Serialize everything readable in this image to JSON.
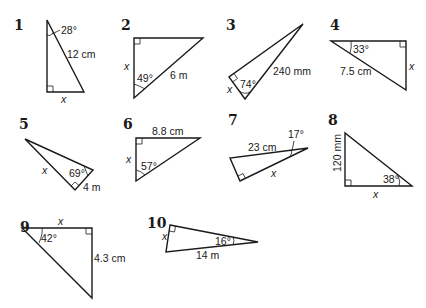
{
  "problems": [
    {
      "number": "1",
      "angle": "28°",
      "side": "12 cm",
      "unknown": "x"
    },
    {
      "number": "2",
      "angle": "49°",
      "side": "6 m",
      "unknown": "x"
    },
    {
      "number": "3",
      "angle": "74°",
      "side": "240 mm",
      "unknown": "x"
    },
    {
      "number": "4",
      "angle": "33°",
      "side": "7.5 cm",
      "unknown": "x"
    },
    {
      "number": "5",
      "angle": "69°",
      "side": "4 m",
      "unknown": "x"
    },
    {
      "number": "6",
      "angle": "57°",
      "side": "8.8 cm",
      "unknown": "x"
    },
    {
      "number": "7",
      "angle": "17°",
      "side": "23 cm",
      "unknown": "x"
    },
    {
      "number": "8",
      "angle": "38°",
      "side": "120 mm",
      "unknown": "x"
    },
    {
      "number": "9",
      "angle": "42°",
      "side": "4.3 cm",
      "unknown": "x"
    },
    {
      "number": "10",
      "angle": "16°",
      "side": "14 m",
      "unknown": "x"
    }
  ]
}
